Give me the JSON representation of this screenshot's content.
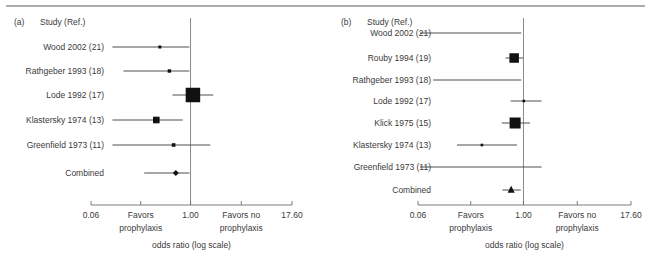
{
  "figure": {
    "top_rule": true,
    "background": "#ffffff",
    "ink_color": "#231f20"
  },
  "axis": {
    "tick_labels": [
      "0.06",
      "1.00",
      "17.60"
    ],
    "tick_values": [
      0.06,
      1.0,
      17.6
    ],
    "favors_left_line1": "Favors",
    "favors_left_line2": "prophylaxis",
    "favors_right_line1": "Favors no",
    "favors_right_line2": "prophylaxis",
    "axis_title": "odds ratio (log scale)",
    "scale": "log",
    "null_value": 1.0
  },
  "panels": [
    {
      "letter": "(a)",
      "column_header": "Study (Ref.)",
      "rows": [
        {
          "label": "Wood 2002 (21)",
          "or": 0.42,
          "lcl": 0.11,
          "ucl": 0.97,
          "marker": "square",
          "marker_size": 3.0
        },
        {
          "label": "Rathgeber 1993 (18)",
          "or": 0.55,
          "lcl": 0.15,
          "ucl": 0.97,
          "marker": "square",
          "marker_size": 3.4
        },
        {
          "label": "Lode 1992 (17)",
          "or": 1.07,
          "lcl": 0.6,
          "ucl": 1.9,
          "marker": "square",
          "marker_size": 14.5
        },
        {
          "label": "Klastersky 1974 (13)",
          "or": 0.38,
          "lcl": 0.11,
          "ucl": 0.8,
          "marker": "square",
          "marker_size": 6.6
        },
        {
          "label": "Greenfield 1973 (11)",
          "or": 0.62,
          "lcl": 0.11,
          "ucl": 1.75,
          "marker": "square",
          "marker_size": 3.6
        },
        {
          "label": "Combined",
          "or": 0.66,
          "lcl": 0.27,
          "ucl": 0.97,
          "marker": "diamond",
          "marker_size": 6.0
        }
      ]
    },
    {
      "letter": "(b)",
      "column_header": "Study (Ref.)",
      "rows": [
        {
          "label": "Wood 2002 (21)",
          "or": null,
          "lcl": 0.06,
          "ucl": 0.94,
          "marker": "none",
          "marker_size": 0
        },
        {
          "label": "Rouby 1994 (19)",
          "or": 0.78,
          "lcl": 0.62,
          "ucl": 0.99,
          "marker": "square",
          "marker_size": 9.5
        },
        {
          "label": "Rathgeber 1993 (18)",
          "or": null,
          "lcl": 0.09,
          "ucl": 0.94,
          "marker": "none",
          "marker_size": 0
        },
        {
          "label": "Lode 1992 (17)",
          "or": 1.01,
          "lcl": 0.71,
          "ucl": 1.62,
          "marker": "square",
          "marker_size": 2.6
        },
        {
          "label": "Klick 1975 (15)",
          "or": 0.8,
          "lcl": 0.56,
          "ucl": 1.19,
          "marker": "square",
          "marker_size": 11.0
        },
        {
          "label": "Klastersky 1974 (13)",
          "or": 0.33,
          "lcl": 0.17,
          "ucl": 0.84,
          "marker": "square",
          "marker_size": 2.6
        },
        {
          "label": "Greenfield 1973 (11)",
          "or": null,
          "lcl": 0.06,
          "ucl": 1.62,
          "marker": "none",
          "marker_size": 0
        },
        {
          "label": "Combined",
          "or": 0.72,
          "lcl": 0.57,
          "ucl": 0.93,
          "marker": "triangle",
          "marker_size": 7.0
        }
      ]
    }
  ],
  "chart_data": {
    "type": "forest",
    "title": "",
    "xlabel": "odds ratio (log scale)",
    "ylabel": "",
    "xscale": "log",
    "xlim": [
      0.06,
      17.6
    ],
    "xticks": [
      0.06,
      1.0,
      17.6
    ],
    "xticklabels": [
      "0.06",
      "1.00",
      "17.60"
    ],
    "reference_line": 1.0,
    "grid": false,
    "legend": "none",
    "annotations": [
      "Favors prophylaxis",
      "Favors no prophylaxis"
    ],
    "subplots": [
      {
        "name": "(a)",
        "categories": [
          "Wood 2002 (21)",
          "Rathgeber 1993 (18)",
          "Lode 1992 (17)",
          "Klastersky 1974 (13)",
          "Greenfield 1973 (11)",
          "Combined"
        ],
        "values": [
          0.42,
          0.55,
          1.07,
          0.38,
          0.62,
          0.66
        ],
        "ci_lower": [
          0.11,
          0.15,
          0.6,
          0.11,
          0.11,
          0.27
        ],
        "ci_upper": [
          0.97,
          0.97,
          1.9,
          0.8,
          1.75,
          0.97
        ],
        "marker_weights": [
          3.0,
          3.4,
          14.5,
          6.6,
          3.6,
          6.0
        ]
      },
      {
        "name": "(b)",
        "categories": [
          "Wood 2002 (21)",
          "Rouby 1994 (19)",
          "Rathgeber 1993 (18)",
          "Lode 1992 (17)",
          "Klick 1975 (15)",
          "Klastersky 1974 (13)",
          "Greenfield 1973 (11)",
          "Combined"
        ],
        "values": [
          null,
          0.78,
          null,
          1.01,
          0.8,
          0.33,
          null,
          0.72
        ],
        "ci_lower": [
          0.06,
          0.62,
          0.09,
          0.71,
          0.56,
          0.17,
          0.06,
          0.57
        ],
        "ci_upper": [
          0.94,
          0.99,
          0.94,
          1.62,
          1.19,
          0.84,
          1.62,
          0.93
        ],
        "marker_weights": [
          0,
          9.5,
          0,
          2.6,
          11.0,
          2.6,
          0,
          7.0
        ]
      }
    ]
  }
}
